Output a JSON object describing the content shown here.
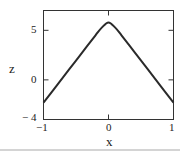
{
  "chart_data": {
    "type": "line",
    "title": "",
    "xlabel": "x",
    "ylabel": "z",
    "xlim": [
      -1,
      1
    ],
    "ylim": [
      -4,
      7
    ],
    "xticks": [
      "-1",
      "0",
      "1"
    ],
    "yticks": [
      "-4",
      "0",
      "5"
    ],
    "grid": false,
    "legend": null,
    "series": [
      {
        "name": "z(x)",
        "x": [
          -1.0,
          -0.8,
          -0.6,
          -0.4,
          -0.2,
          -0.1,
          0.0,
          0.1,
          0.2,
          0.4,
          0.6,
          0.8,
          1.0
        ],
        "y": [
          -2.3,
          -0.6,
          1.1,
          2.8,
          4.5,
          5.3,
          5.8,
          5.3,
          4.5,
          2.8,
          1.1,
          -0.6,
          -2.3
        ]
      }
    ]
  },
  "labels": {
    "ytick_5": "5",
    "ytick_0": "0",
    "ytick_m4": "− 4",
    "xtick_m1": "−1",
    "xtick_0": "0",
    "xtick_1": "1",
    "xlabel": "x",
    "ylabel": "z"
  }
}
